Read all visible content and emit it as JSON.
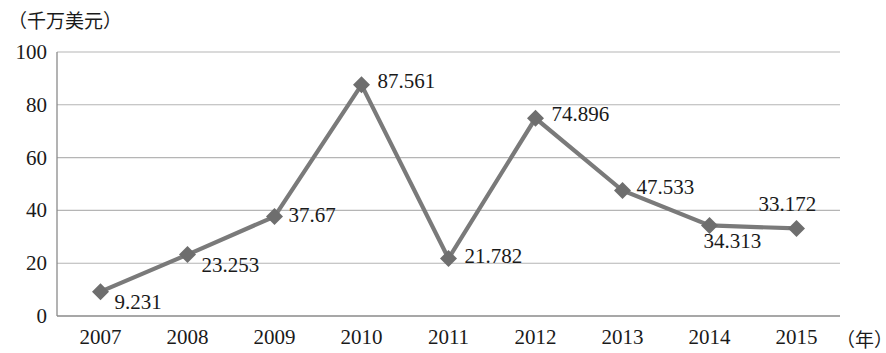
{
  "chart_data": {
    "type": "line",
    "title": "",
    "subtitle": "",
    "xlabel": "（年）",
    "ylabel": "（千万美元）",
    "categories": [
      "2007",
      "2008",
      "2009",
      "2010",
      "2011",
      "2012",
      "2013",
      "2014",
      "2015"
    ],
    "values": [
      9.231,
      23.253,
      37.67,
      87.561,
      21.782,
      74.896,
      47.533,
      34.313,
      33.172
    ],
    "point_labels": [
      "9.231",
      "23.253",
      "37.67",
      "87.561",
      "21.782",
      "74.896",
      "47.533",
      "34.313",
      "33.172"
    ],
    "ylim": [
      0,
      100
    ],
    "yticks": [
      "0",
      "20",
      "40",
      "60",
      "80",
      "100"
    ],
    "ytick_values": [
      0,
      20,
      40,
      60,
      80,
      100
    ],
    "grid": true,
    "grid_axis": "y",
    "legend": false,
    "legend_position": "none",
    "series": [
      {
        "name": "",
        "values": [
          9.231,
          23.253,
          37.67,
          87.561,
          21.782,
          74.896,
          47.533,
          34.313,
          33.172
        ],
        "marker": "diamond",
        "color": "#7a7a7a"
      }
    ],
    "colors": {
      "line": "#7a7a7a",
      "marker": "#6e6e6e",
      "grid": "#b5b5b5",
      "axis": "#8a8a8a",
      "text": "#1a1a1a",
      "background": "#ffffff"
    },
    "label_offsets": [
      {
        "dx": 14,
        "dy": 10
      },
      {
        "dx": 14,
        "dy": 10
      },
      {
        "dx": 14,
        "dy": -2
      },
      {
        "dx": 16,
        "dy": -4
      },
      {
        "dx": 16,
        "dy": -2
      },
      {
        "dx": 16,
        "dy": -4
      },
      {
        "dx": 14,
        "dy": -4
      },
      {
        "dx": -6,
        "dy": 16
      },
      {
        "dx": -38,
        "dy": -24
      }
    ]
  }
}
